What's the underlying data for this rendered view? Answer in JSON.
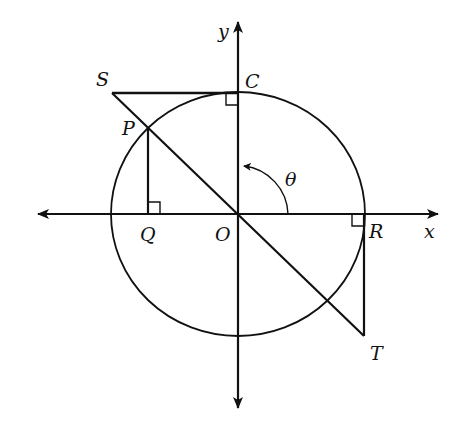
{
  "diagram": {
    "type": "unit-circle-trig-geometry",
    "stroke_color": "#111111",
    "background": "#ffffff",
    "labels": {
      "y_axis": "y",
      "x_axis": "x",
      "S": "S",
      "C": "C",
      "P": "P",
      "Q": "Q",
      "O": "O",
      "R": "R",
      "T": "T",
      "theta": "θ"
    },
    "points": {
      "O": [
        238,
        214
      ],
      "C": [
        238,
        93
      ],
      "S": [
        112,
        93
      ],
      "P": [
        148,
        128
      ],
      "Q": [
        148,
        214
      ],
      "R": [
        364,
        214
      ],
      "T": [
        364,
        336
      ]
    },
    "circle": {
      "cx": 238,
      "cy": 214,
      "rx": 127,
      "ry": 122
    },
    "right_angles": [
      "C",
      "Q",
      "R"
    ],
    "angle": {
      "vertex": "O",
      "from": "x-axis",
      "to": "y-axis",
      "label": "θ"
    }
  }
}
